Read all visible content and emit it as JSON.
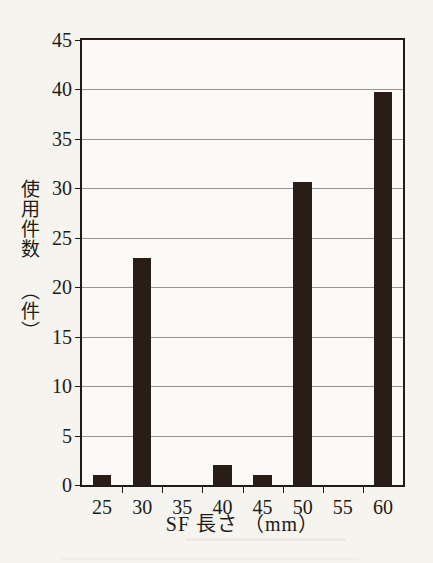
{
  "chart_data": {
    "type": "bar",
    "title": "",
    "xlabel": "SF 長さ （mm）",
    "ylabel": "使用件数 （件）",
    "categories": [
      "25",
      "30",
      "35",
      "40",
      "45",
      "50",
      "55",
      "60"
    ],
    "values": [
      1,
      23,
      0,
      2,
      1,
      30.6,
      0,
      39.7
    ],
    "series": [
      {
        "name": "使用件数",
        "values": [
          1,
          23,
          0,
          2,
          1,
          30.6,
          0,
          39.7
        ]
      }
    ],
    "ylim": [
      0,
      45
    ],
    "ytick_labels": [
      "0",
      "5",
      "10",
      "15",
      "20",
      "25",
      "30",
      "35",
      "40",
      "45"
    ],
    "ytick_values": [
      0,
      5,
      10,
      15,
      20,
      25,
      30,
      35,
      40,
      45
    ],
    "grid": true,
    "legend": "none",
    "bar_color": "#2a1d18",
    "axis_color": "#211a15",
    "grid_color": "#9a948c",
    "background_color": "#f6f4ef",
    "plot_background_color": "#fbfaf6"
  }
}
